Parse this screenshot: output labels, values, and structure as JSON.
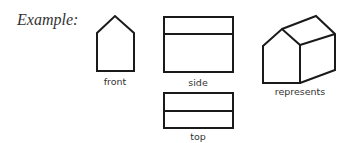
{
  "title": "Example:",
  "views": {
    "front": {
      "label": "front"
    },
    "side": {
      "label": "side"
    },
    "top": {
      "label": "top"
    },
    "isometric": {
      "label": "represents"
    }
  },
  "colors": {
    "stroke": "#1a1a1a",
    "text": "#333333",
    "background": "#ffffff"
  }
}
